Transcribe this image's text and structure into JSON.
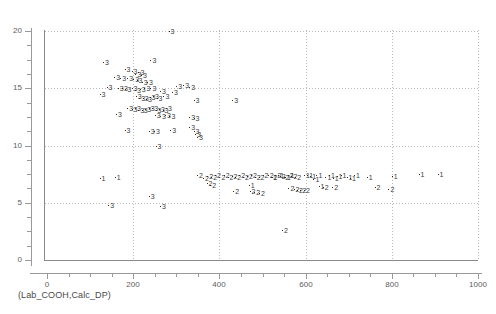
{
  "caption": "(Lab_COOH,Calc_DP)",
  "colors": {
    "axis": "#8a8a8a",
    "grid": "#b9b9b9",
    "marker": "#3a3a3a",
    "background": "#ffffff"
  },
  "chart_data": {
    "type": "scatter",
    "title": "",
    "subtitle": "",
    "xlabel": "Lab_COOH",
    "ylabel": "Calc_DP",
    "annotation": "(Lab_COOH,Calc_DP)",
    "xlim": [
      0,
      1000
    ],
    "ylim": [
      0,
      20
    ],
    "xticks": [
      0,
      200,
      400,
      600,
      800,
      1000
    ],
    "yticks": [
      0,
      5,
      10,
      15,
      20
    ],
    "xtick_labels": [
      "0",
      "200",
      "400",
      "600",
      "800",
      "1000"
    ],
    "ytick_labels": [
      "0",
      "5",
      "10",
      "15",
      "20"
    ],
    "xminor_step": 50,
    "yminor_step": 1.25,
    "grid": true,
    "grid_style": "dotted",
    "legend": "none",
    "marker_style": "dot-with-group-number",
    "group_labels": [
      "1",
      "2",
      "3"
    ],
    "series": [
      {
        "name": "1",
        "label": "1",
        "points": [
          [
            122,
            7.05
          ],
          [
            157,
            7.2
          ],
          [
            596,
            7.3
          ],
          [
            604,
            7.35
          ],
          [
            611,
            7.25
          ],
          [
            618,
            7.0
          ],
          [
            625,
            7.3
          ],
          [
            646,
            7.2
          ],
          [
            654,
            7.35
          ],
          [
            663,
            7.1
          ],
          [
            672,
            7.25
          ],
          [
            681,
            7.3
          ],
          [
            695,
            7.2
          ],
          [
            703,
            7.1
          ],
          [
            712,
            7.3
          ],
          [
            742,
            7.15
          ],
          [
            800,
            7.25
          ],
          [
            862,
            7.45
          ],
          [
            906,
            7.4
          ],
          [
            630,
            6.35
          ],
          [
            468,
            6.45
          ],
          [
            520,
            7.15
          ],
          [
            536,
            7.3
          ],
          [
            552,
            7.2
          ],
          [
            560,
            7.35
          ]
        ]
      },
      {
        "name": "2",
        "label": "2",
        "points": [
          [
            348,
            7.3
          ],
          [
            362,
            7.1
          ],
          [
            372,
            7.25
          ],
          [
            381,
            7.2
          ],
          [
            390,
            7.35
          ],
          [
            400,
            7.15
          ],
          [
            410,
            7.3
          ],
          [
            419,
            7.2
          ],
          [
            428,
            7.25
          ],
          [
            437,
            7.15
          ],
          [
            446,
            7.3
          ],
          [
            455,
            7.2
          ],
          [
            464,
            7.25
          ],
          [
            473,
            7.3
          ],
          [
            482,
            7.2
          ],
          [
            491,
            7.15
          ],
          [
            500,
            7.3
          ],
          [
            512,
            7.35
          ],
          [
            521,
            7.2
          ],
          [
            530,
            7.3
          ],
          [
            540,
            7.25
          ],
          [
            549,
            7.2
          ],
          [
            558,
            7.3
          ],
          [
            567,
            7.25
          ],
          [
            576,
            7.2
          ],
          [
            370,
            6.6
          ],
          [
            379,
            6.5
          ],
          [
            432,
            5.95
          ],
          [
            470,
            5.9
          ],
          [
            481,
            5.85
          ],
          [
            492,
            5.75
          ],
          [
            560,
            6.2
          ],
          [
            572,
            6.1
          ],
          [
            580,
            6.05
          ],
          [
            588,
            6.0
          ],
          [
            596,
            6.05
          ],
          [
            640,
            6.25
          ],
          [
            662,
            6.3
          ],
          [
            760,
            6.3
          ],
          [
            792,
            6.1
          ],
          [
            545,
            2.5
          ]
        ]
      },
      {
        "name": "3",
        "label": "3",
        "points": [
          [
            282,
            19.9
          ],
          [
            130,
            17.2
          ],
          [
            240,
            17.4
          ],
          [
            180,
            16.6
          ],
          [
            196,
            16.4
          ],
          [
            205,
            16.2
          ],
          [
            212,
            16.3
          ],
          [
            218,
            16.1
          ],
          [
            156,
            15.9
          ],
          [
            170,
            15.85
          ],
          [
            186,
            15.8
          ],
          [
            200,
            15.7
          ],
          [
            208,
            15.6
          ],
          [
            220,
            15.5
          ],
          [
            232,
            15.45
          ],
          [
            138,
            15.0
          ],
          [
            164,
            14.95
          ],
          [
            174,
            14.9
          ],
          [
            182,
            14.85
          ],
          [
            196,
            14.9
          ],
          [
            204,
            14.8
          ],
          [
            215,
            14.85
          ],
          [
            226,
            14.9
          ],
          [
            240,
            14.95
          ],
          [
            300,
            15.15
          ],
          [
            316,
            15.2
          ],
          [
            330,
            15.05
          ],
          [
            122,
            14.4
          ],
          [
            262,
            14.7
          ],
          [
            290,
            14.6
          ],
          [
            206,
            14.2
          ],
          [
            214,
            14.1
          ],
          [
            222,
            14.05
          ],
          [
            230,
            14.0
          ],
          [
            238,
            14.15
          ],
          [
            246,
            14.2
          ],
          [
            254,
            14.1
          ],
          [
            270,
            14.25
          ],
          [
            340,
            13.9
          ],
          [
            430,
            13.85
          ],
          [
            186,
            13.2
          ],
          [
            196,
            13.1
          ],
          [
            204,
            13.15
          ],
          [
            212,
            13.05
          ],
          [
            220,
            13.0
          ],
          [
            228,
            13.1
          ],
          [
            236,
            13.2
          ],
          [
            244,
            13.15
          ],
          [
            252,
            13.0
          ],
          [
            260,
            13.1
          ],
          [
            268,
            13.05
          ],
          [
            276,
            13.15
          ],
          [
            160,
            12.7
          ],
          [
            250,
            12.6
          ],
          [
            262,
            12.5
          ],
          [
            274,
            12.55
          ],
          [
            284,
            12.45
          ],
          [
            330,
            12.4
          ],
          [
            340,
            12.35
          ],
          [
            180,
            11.3
          ],
          [
            236,
            11.2
          ],
          [
            248,
            11.15
          ],
          [
            286,
            11.3
          ],
          [
            330,
            11.5
          ],
          [
            340,
            11.2
          ],
          [
            344,
            10.9
          ],
          [
            348,
            10.7
          ],
          [
            252,
            9.9
          ],
          [
            236,
            5.5
          ],
          [
            142,
            4.7
          ],
          [
            262,
            4.6
          ]
        ]
      }
    ]
  }
}
